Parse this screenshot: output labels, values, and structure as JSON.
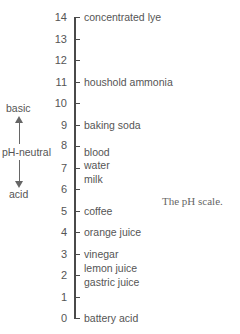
{
  "title": "pH scale",
  "caption": "The pH scale.",
  "scale": {
    "ticks": [
      "0",
      "1",
      "2",
      "3",
      "4",
      "5",
      "6",
      "7",
      "8",
      "9",
      "10",
      "11",
      "12",
      "13",
      "14"
    ]
  },
  "labels": {
    "l14": "concentrated lye",
    "l11": "houshold ammonia",
    "l9": "baking soda",
    "blood": "blood",
    "water": "water",
    "milk": "milk",
    "l5": "coffee",
    "l4": "orange juice",
    "l3": "vinegar",
    "lemon": "lemon juice",
    "gastric": "gastric juice",
    "l0": "battery acid"
  },
  "side": {
    "basic": "basic",
    "neutral": "pH-neutral",
    "acid": "acid"
  },
  "colors": {
    "axis": "#4a4a4a",
    "text": "#555555"
  }
}
